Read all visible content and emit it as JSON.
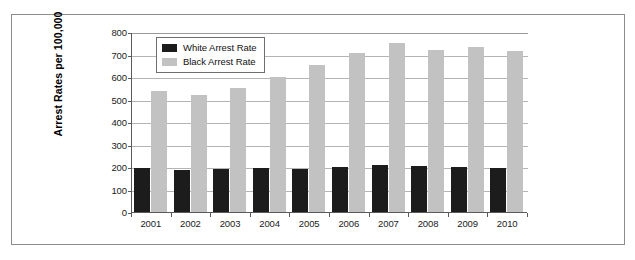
{
  "chart_data": {
    "type": "bar",
    "title": "",
    "subtitle": "",
    "xlabel": "",
    "ylabel": "Arrest Rates per 100,000",
    "ylim": [
      0,
      800
    ],
    "ytick_step": 100,
    "yticks": [
      "800",
      "700",
      "600",
      "500",
      "400",
      "300",
      "200",
      "100",
      "0"
    ],
    "ytick_values": [
      800,
      700,
      600,
      500,
      400,
      300,
      200,
      100,
      0
    ],
    "grid": true,
    "grid_axis": "y",
    "legend_position": "upper-left-inside",
    "categories": [
      "2001",
      "2002",
      "2003",
      "2004",
      "2005",
      "2006",
      "2007",
      "2008",
      "2009",
      "2010"
    ],
    "series": [
      {
        "name": "White Arrest Rate",
        "color": "#1c1c1c",
        "values": [
          195,
          185,
          190,
          196,
          189,
          201,
          208,
          203,
          199,
          194
        ]
      },
      {
        "name": "Black Arrest Rate",
        "color": "#c2c2c2",
        "values": [
          537,
          522,
          553,
          602,
          652,
          705,
          750,
          722,
          735,
          715
        ]
      }
    ],
    "annotations": []
  },
  "legend": {
    "items": [
      {
        "label": "White Arrest Rate",
        "swatch_name": "legend-swatch-white-arrest-rate"
      },
      {
        "label": "Black Arrest Rate",
        "swatch_name": "legend-swatch-black-arrest-rate"
      }
    ]
  },
  "colors": {
    "white_arrest_rate": "#1c1c1c",
    "black_arrest_rate": "#c2c2c2",
    "gridline": "#b4b4b4",
    "axis": "#5a5a5a",
    "frame_border": "#8b8b8b",
    "background": "#ffffff"
  }
}
